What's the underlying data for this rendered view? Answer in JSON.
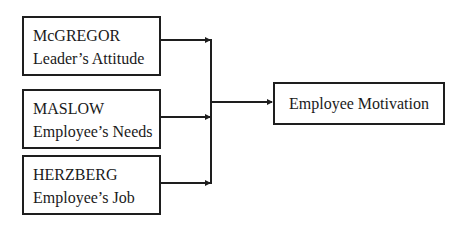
{
  "diagram": {
    "type": "flow",
    "sources": [
      {
        "id": "mcgregor",
        "title": "McGREGOR",
        "subtitle": "Leader’s Attitude"
      },
      {
        "id": "maslow",
        "title": "MASLOW",
        "subtitle": "Employee’s Needs"
      },
      {
        "id": "herzberg",
        "title": "HERZBERG",
        "subtitle": "Employee’s Job"
      }
    ],
    "target": {
      "id": "motivation",
      "label": "Employee Motivation"
    },
    "edges": [
      {
        "from": "mcgregor",
        "to": "motivation"
      },
      {
        "from": "maslow",
        "to": "motivation"
      },
      {
        "from": "herzberg",
        "to": "motivation"
      }
    ],
    "colors": {
      "stroke": "#1e1e1e",
      "background": "#ffffff",
      "text": "#1a1a1a"
    }
  }
}
